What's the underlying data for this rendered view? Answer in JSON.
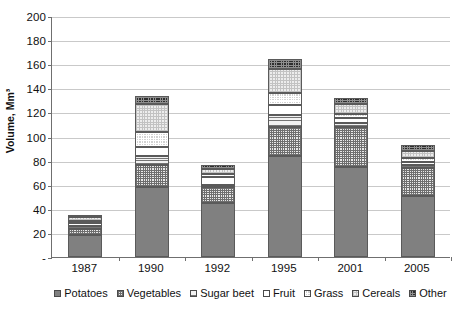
{
  "chart_data": {
    "type": "bar",
    "title": "",
    "subtitle": "",
    "xlabel": "",
    "ylabel": "Volume, Mm³",
    "stacked": true,
    "grid": true,
    "legend_position": "bottom",
    "ylim": [
      0,
      200
    ],
    "yticks": [
      0,
      20,
      40,
      60,
      80,
      100,
      120,
      140,
      160,
      180,
      200
    ],
    "ytick_labels": [
      "-",
      "20",
      "40",
      "60",
      "80",
      "100",
      "120",
      "140",
      "160",
      "180",
      "200"
    ],
    "categories": [
      "1987",
      "1990",
      "1992",
      "1995",
      "2001",
      "2005"
    ],
    "series": [
      {
        "name": "Potatoes",
        "values": [
          18,
          58,
          45,
          84,
          75,
          51
        ]
      },
      {
        "name": "Vegetables",
        "values": [
          5,
          18,
          13,
          24,
          33,
          23
        ]
      },
      {
        "name": "Sugar beet",
        "values": [
          3,
          8,
          2,
          10,
          3,
          2
        ]
      },
      {
        "name": "Fruit",
        "values": [
          2,
          7,
          6,
          8,
          4,
          3
        ]
      },
      {
        "name": "Grass",
        "values": [
          2,
          13,
          3,
          10,
          4,
          3
        ]
      },
      {
        "name": "Cereals",
        "values": [
          3,
          23,
          4,
          20,
          8,
          6
        ]
      },
      {
        "name": "Other",
        "values": [
          2,
          7,
          3,
          8,
          5,
          5
        ]
      }
    ],
    "totals": [
      35,
      134,
      76,
      164,
      132,
      93
    ],
    "colors": {
      "Potatoes": "#808080",
      "Vegetables": "#e8e8e8",
      "Sugar beet": "#f2f2f2",
      "Fruit": "#ffffff",
      "Grass": "#d2d2d2",
      "Cereals": "#ededed",
      "Other": "#2e2e2e"
    }
  },
  "legend": {
    "items": [
      {
        "label": "Potatoes",
        "pattern": "p-potatoes"
      },
      {
        "label": "Vegetables",
        "pattern": "p-vegetables"
      },
      {
        "label": "Sugar beet",
        "pattern": "p-sugarbeet"
      },
      {
        "label": "Fruit",
        "pattern": "p-fruit"
      },
      {
        "label": "Grass",
        "pattern": "p-grass"
      },
      {
        "label": "Cereals",
        "pattern": "p-cereals"
      },
      {
        "label": "Other",
        "pattern": "p-other"
      }
    ]
  }
}
